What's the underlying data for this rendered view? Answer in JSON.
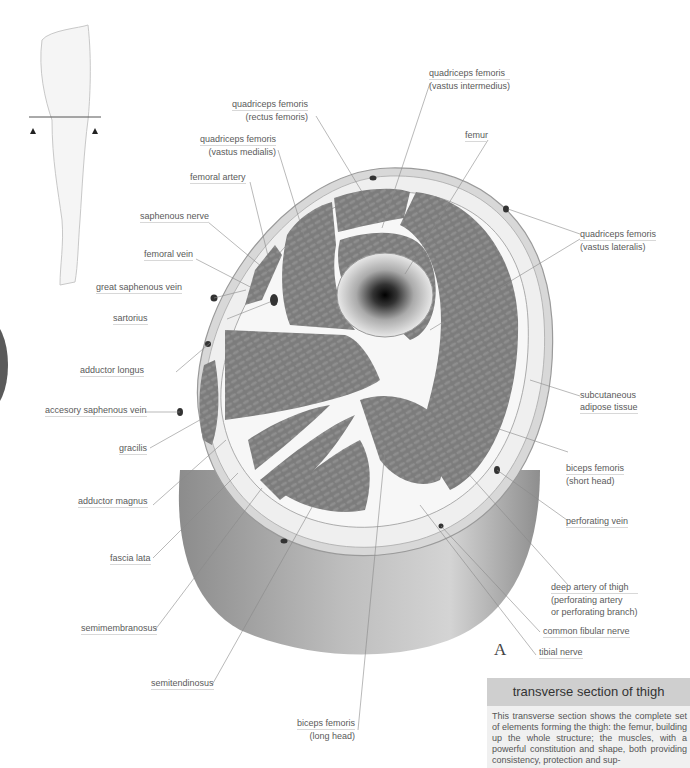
{
  "figure": {
    "letter": "A",
    "section_marker": "arrow-up-icon"
  },
  "labels": {
    "vastus_intermedius": [
      "quadriceps femoris",
      "(vastus intermedius)"
    ],
    "rectus_femoris": [
      "quadriceps femoris",
      "(rectus femoris)"
    ],
    "vastus_medialis": [
      "quadriceps femoris",
      "(vastus medialis)"
    ],
    "femur": "femur",
    "femoral_artery": "femoral artery",
    "saphenous_nerve": "saphenous nerve",
    "femoral_vein": "femoral vein",
    "great_saphenous_vein": "great saphenous vein",
    "sartorius": "sartorius",
    "vastus_lateralis": [
      "quadriceps femoris",
      "(vastus lateralis)"
    ],
    "adductor_longus": "adductor longus",
    "accesory_saphenous_vein": "accesory saphenous vein",
    "subcutaneous": [
      "subcutaneous",
      "adipose tissue"
    ],
    "gracilis": "gracilis",
    "biceps_short": [
      "biceps femoris",
      "(short head)"
    ],
    "adductor_magnus": "adductor magnus",
    "perforating_vein": "perforating vein",
    "fascia_lata": "fascia lata",
    "deep_artery": [
      "deep artery of thigh",
      "(perforating artery",
      "or perforating branch)"
    ],
    "semimembranosus": "semimembranosus",
    "common_fibular_nerve": "common fibular nerve",
    "tibial_nerve": "tibial nerve",
    "semitendinosus": "semitendinosus",
    "biceps_long": [
      "biceps femoris",
      "(long head)"
    ]
  },
  "caption": {
    "title": "transverse section of thigh",
    "body": "This transverse section shows the complete set of elements forming the thigh: the femur, building up the whole structure; the muscles, with a powerful constitution and shape, both providing consistency, protection and sup-"
  },
  "colors": {
    "muscle": "#7a7a7a",
    "fat": "#ececec",
    "skin_ring": "#d6d6d6",
    "cylinder": "#a9a9a9",
    "caption_header": "#cfcfcf",
    "caption_bg": "#f0f0f0"
  }
}
